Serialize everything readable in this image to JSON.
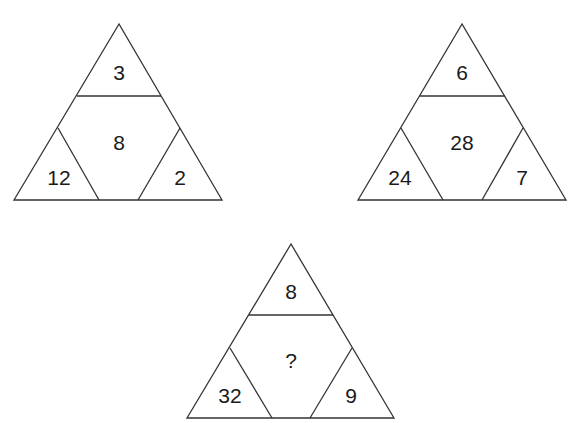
{
  "puzzle": {
    "triangles": [
      {
        "top": "3",
        "center": "8",
        "left": "12",
        "right": "2"
      },
      {
        "top": "6",
        "center": "28",
        "left": "24",
        "right": "7"
      },
      {
        "top": "8",
        "center": "?",
        "left": "32",
        "right": "9"
      }
    ]
  },
  "colors": {
    "line": "#333333",
    "text": "#1a1a1a",
    "background": "#ffffff"
  }
}
